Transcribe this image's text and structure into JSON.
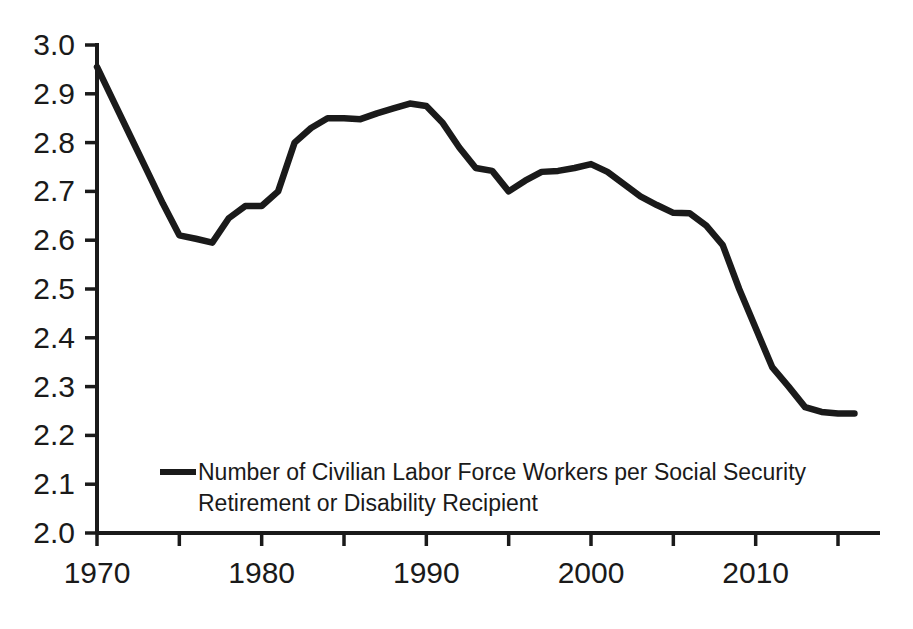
{
  "chart_data": {
    "type": "line",
    "title": "",
    "xlabel": "",
    "ylabel": "",
    "xlim": [
      1970,
      2016
    ],
    "ylim": [
      2.0,
      3.0
    ],
    "grid": false,
    "legend_position": "inside-bottom-left",
    "series": [
      {
        "name": "Number of Civilian Labor Force Workers per Social Security Retirement or Disability Recipient",
        "x": [
          1970,
          1971,
          1972,
          1973,
          1974,
          1975,
          1976,
          1977,
          1978,
          1979,
          1980,
          1981,
          1982,
          1983,
          1984,
          1985,
          1986,
          1987,
          1988,
          1989,
          1990,
          1991,
          1992,
          1993,
          1994,
          1995,
          1996,
          1997,
          1998,
          1999,
          2000,
          2001,
          2002,
          2003,
          2004,
          2005,
          2006,
          2007,
          2008,
          2009,
          2010,
          2011,
          2012,
          2013,
          2014,
          2015,
          2016
        ],
        "values": [
          2.955,
          2.885,
          2.815,
          2.745,
          2.675,
          2.61,
          2.603,
          2.595,
          2.645,
          2.67,
          2.67,
          2.7,
          2.8,
          2.83,
          2.85,
          2.85,
          2.848,
          2.86,
          2.87,
          2.88,
          2.875,
          2.84,
          2.79,
          2.748,
          2.742,
          2.7,
          2.722,
          2.74,
          2.742,
          2.748,
          2.756,
          2.74,
          2.715,
          2.69,
          2.672,
          2.656,
          2.655,
          2.63,
          2.59,
          2.5,
          2.42,
          2.34,
          2.3,
          2.258,
          2.248,
          2.245,
          2.245
        ]
      }
    ],
    "y_ticks": [
      {
        "value": 2.0,
        "label": "2.0"
      },
      {
        "value": 2.1,
        "label": "2.1"
      },
      {
        "value": 2.2,
        "label": "2.2"
      },
      {
        "value": 2.3,
        "label": "2.3"
      },
      {
        "value": 2.4,
        "label": "2.4"
      },
      {
        "value": 2.5,
        "label": "2.5"
      },
      {
        "value": 2.6,
        "label": "2.6"
      },
      {
        "value": 2.7,
        "label": "2.7"
      },
      {
        "value": 2.8,
        "label": "2.8"
      },
      {
        "value": 2.9,
        "label": "2.9"
      },
      {
        "value": 3.0,
        "label": "3.0"
      }
    ],
    "x_ticks": [
      {
        "value": 1970,
        "label": "1970"
      },
      {
        "value": 1975,
        "label": ""
      },
      {
        "value": 1980,
        "label": "1980"
      },
      {
        "value": 1985,
        "label": ""
      },
      {
        "value": 1990,
        "label": "1990"
      },
      {
        "value": 1995,
        "label": ""
      },
      {
        "value": 2000,
        "label": "2000"
      },
      {
        "value": 2005,
        "label": ""
      },
      {
        "value": 2010,
        "label": "2010"
      },
      {
        "value": 2015,
        "label": ""
      }
    ],
    "line_color": "#1a1a1a",
    "background_color": "#ffffff"
  },
  "legend": {
    "line1": "Number of Civilian Labor Force Workers per Social Security",
    "line2": "Retirement or Disability Recipient",
    "marker": "line-marker"
  }
}
